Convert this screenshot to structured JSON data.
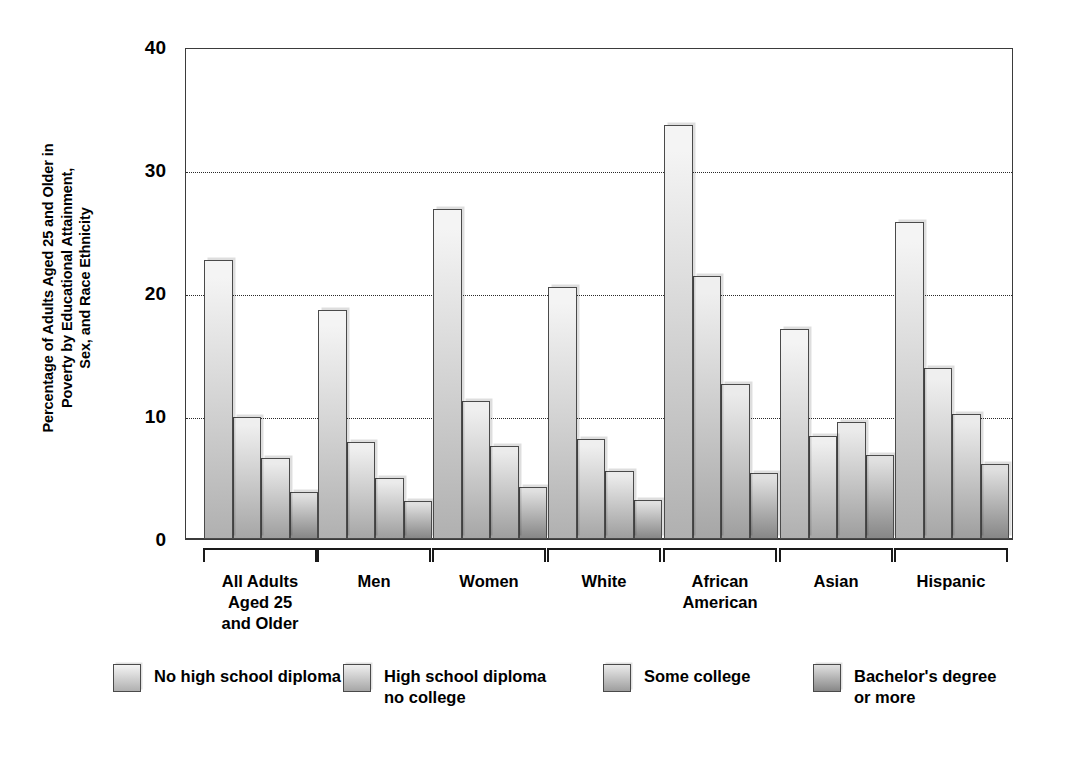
{
  "chart_data": {
    "type": "bar",
    "title": "",
    "xlabel": "",
    "ylabel": "Percentage of Adults Aged 25 and Older in Poverty by Educational Attainment, Sex, and Race Ethnicity",
    "ylabel_lines": [
      "Percentage of Adults Aged 25 and Older in",
      "Poverty by Educational Attainment,",
      "Sex, and Race Ethnicity"
    ],
    "ylim": [
      0,
      40
    ],
    "yticks": [
      0,
      10,
      20,
      30,
      40
    ],
    "ytick_labels": [
      "0",
      "10",
      "20",
      "30",
      "40"
    ],
    "gridlines": [
      10,
      20,
      30
    ],
    "grid": true,
    "legend_position": "bottom",
    "categories": [
      "All Adults\nAged 25\nand Older",
      "Men",
      "Women",
      "White",
      "African\nAmerican",
      "Asian",
      "Hispanic"
    ],
    "series": [
      {
        "name": "No high school diploma",
        "color": "#dddddd",
        "values": [
          22.7,
          18.6,
          26.8,
          20.5,
          33.7,
          17.1,
          25.8
        ]
      },
      {
        "name": "High school diploma\nno college",
        "color": "#cfcfcf",
        "values": [
          9.9,
          7.9,
          11.2,
          8.1,
          21.4,
          8.4,
          13.9
        ]
      },
      {
        "name": "Some college",
        "color": "#c4c4c4",
        "values": [
          6.6,
          5.0,
          7.6,
          5.5,
          12.6,
          9.5,
          10.2
        ]
      },
      {
        "name": "Bachelor's degree\nor more",
        "color": "#a8a8a8",
        "values": [
          3.8,
          3.1,
          4.2,
          3.2,
          5.4,
          6.8,
          6.1
        ]
      }
    ]
  },
  "colors": {
    "axis": "#3b3b3b",
    "grid": "#2a2a2a",
    "bar_outline": "#4a4a4a",
    "background": "#ffffff",
    "text": "#000000"
  },
  "legend": {
    "items": [
      "No high school diploma",
      "High school diploma\nno college",
      "Some college",
      "Bachelor's degree\nor more"
    ]
  }
}
